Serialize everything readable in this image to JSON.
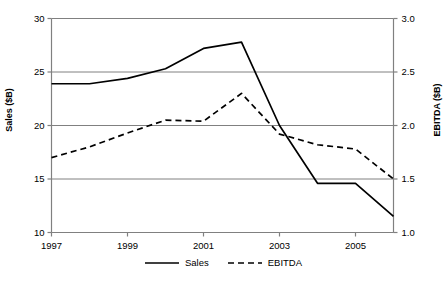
{
  "chart_data": {
    "type": "line",
    "title": "",
    "subtitle": "",
    "xlabel": "",
    "ylabel": "Sales ($B)",
    "y2label": "EBITDA ($B)",
    "grid": true,
    "legend_position": "bottom-center",
    "xlim": [
      1997,
      2006
    ],
    "ylim": [
      10,
      30
    ],
    "y2lim": [
      1.0,
      3.0
    ],
    "xticks": [
      1997,
      1999,
      2001,
      2003,
      2005
    ],
    "xtick_labels": [
      "1997",
      "1999",
      "2001",
      "2003",
      "2005"
    ],
    "yticks": [
      10,
      15,
      20,
      25,
      30
    ],
    "ytick_labels": [
      "10",
      "15",
      "20",
      "25",
      "30"
    ],
    "y2ticks": [
      1.0,
      1.5,
      2.0,
      2.5,
      3.0
    ],
    "y2tick_labels": [
      "1.0",
      "1.5",
      "2.0",
      "2.5",
      "3.0"
    ],
    "x": [
      1997,
      1998,
      1999,
      2000,
      2001,
      2002,
      2003,
      2004,
      2005,
      2006
    ],
    "series": [
      {
        "name": "Sales",
        "axis": "left",
        "style": "solid",
        "color": "#000000",
        "values": [
          23.9,
          23.9,
          24.4,
          25.3,
          27.2,
          27.8,
          20.0,
          14.6,
          14.6,
          11.5
        ]
      },
      {
        "name": "EBITDA",
        "axis": "right",
        "style": "dashed",
        "color": "#000000",
        "values": [
          1.7,
          1.8,
          1.93,
          2.05,
          2.04,
          2.3,
          1.92,
          1.82,
          1.78,
          1.5
        ]
      }
    ]
  },
  "axes": {
    "left_title": "Sales ($B)",
    "right_title": "EBITDA ($B)"
  },
  "legend": {
    "items": [
      {
        "label": "Sales",
        "style": "solid"
      },
      {
        "label": "EBITDA",
        "style": "dashed"
      }
    ]
  },
  "colors": {
    "line": "#000000",
    "grid": "#808080",
    "axis": "#808080",
    "background": "#ffffff"
  }
}
